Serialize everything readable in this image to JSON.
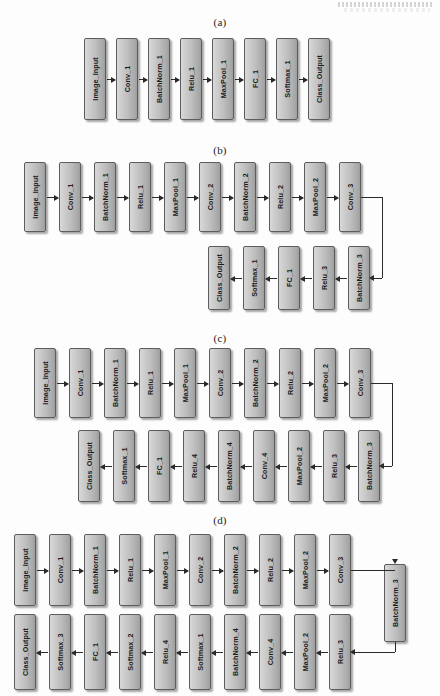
{
  "figure": {
    "panels": [
      {
        "id": "a",
        "label": "(a)",
        "rows": [
          {
            "direction": "left-to-right",
            "nodes": [
              "Image_Input",
              "Conv_1",
              "BatchNorm_1",
              "Relu_1",
              "MaxPool_1",
              "FC_1",
              "Softmax_1",
              "Class_Output"
            ]
          }
        ]
      },
      {
        "id": "b",
        "label": "(b)",
        "rows": [
          {
            "direction": "left-to-right",
            "nodes": [
              "Image_Input",
              "Conv_1",
              "BatchNorm_1",
              "Relu_1",
              "MaxPool_1",
              "Conv_2",
              "BatchNorm_2",
              "Relu_2",
              "MaxPool_2",
              "Conv_3"
            ]
          },
          {
            "direction": "right-to-left",
            "nodes": [
              "Class_Output",
              "Softmax_1",
              "FC_1",
              "Relu_3",
              "BatchNorm_3"
            ]
          }
        ]
      },
      {
        "id": "c",
        "label": "(c)",
        "rows": [
          {
            "direction": "left-to-right",
            "nodes": [
              "Image_Input",
              "Conv_1",
              "BatchNorm_1",
              "Relu_1",
              "MaxPool_1",
              "Conv_2",
              "BatchNorm_2",
              "Relu_2",
              "MaxPool_2",
              "Conv_3"
            ]
          },
          {
            "direction": "right-to-left",
            "nodes": [
              "Class_Output",
              "Softmax_1",
              "FC_1",
              "Relu_4",
              "BatchNorm_4",
              "Conv_4",
              "MaxPool_2",
              "Relu_3",
              "BatchNorm_3"
            ]
          }
        ]
      },
      {
        "id": "d",
        "label": "(d)",
        "rows": [
          {
            "direction": "left-to-right",
            "nodes": [
              "Image_Input",
              "Conv_1",
              "BatchNorm_1",
              "Relu_1",
              "MaxPool_1",
              "Conv_2",
              "BatchNorm_2",
              "Relu_2",
              "MaxPool_2",
              "Conv_3"
            ]
          },
          {
            "direction": "right-to-left",
            "nodes": [
              "Class_Output",
              "Softmax_3",
              "FC_1",
              "Softmax_2",
              "Relu_4",
              "Softmax_1",
              "BatchNorm_4",
              "Conv_4",
              "MaxPool_2",
              "Relu_3"
            ]
          }
        ],
        "bridge_node": "BatchNorm_3"
      }
    ],
    "colors": {
      "node_fill_light": "#d8d8d8",
      "node_fill_dark": "#9e9e9e",
      "node_border": "#5d5d5d",
      "arrow": "#2a2a2a",
      "background": "#fdfdfd",
      "label_text": "#1b1b1b"
    }
  }
}
